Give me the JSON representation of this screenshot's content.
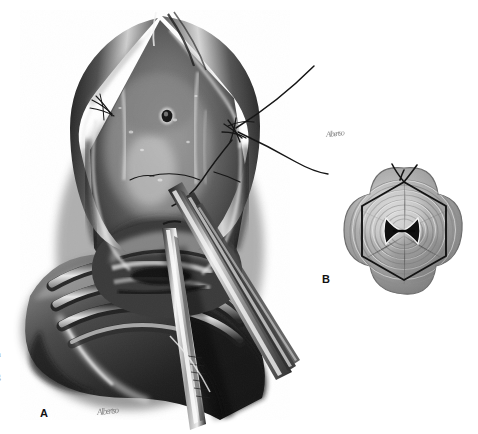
{
  "figure": {
    "medium": "grayscale airbrush and pencil medical illustration",
    "background_color": "#ffffff",
    "width": 478,
    "height": 434,
    "panels": [
      {
        "id": "A",
        "label": "A",
        "label_position": {
          "x": 40,
          "y": 407
        },
        "caption": "Open operative field, tissue edges retracted, suture placed with curved needle, forceps introduced into lumen",
        "signature": "Albertso"
      },
      {
        "id": "B",
        "label": "B",
        "label_position": {
          "x": 322,
          "y": 273
        },
        "caption": "Cross-section: four-lobed fibrous wall with concentric rings, hexagonal encircling suture, central bowtie-shaped lumen",
        "signature": "Albertso"
      }
    ]
  },
  "margin": {
    "clipped_lines": [
      "t",
      "n",
      "f",
      "g"
    ],
    "note": "partial clipped text from facing page column"
  },
  "palette": {
    "paper": "#ffffff",
    "tissue_dark": "#2b2b2b",
    "tissue_mid": "#6d6d6d",
    "tissue_light": "#c9c9c9",
    "highlight": "#f2f2f2",
    "suture": "#1a1a1a",
    "instrument_steel": "#dcdcdc",
    "instrument_shadow": "#3a3a3a",
    "panelb_fiber": "#9b9b9b",
    "label_color": "#111111",
    "signature_color": "#6a6a6a"
  },
  "elements": {
    "panel_a": {
      "retracted_flaps": "two triangular tissue flaps peeled laterally forming an inverted V opening",
      "orifice": "small dark punctate opening with light rim, upper mid-field",
      "cartilage_rings": "three to four curved pale tracheal rings, lower left",
      "suture_threads": "long black monofilament strands trailing to upper right",
      "needle_bite": "suture knot / needle pass at right tissue edge",
      "instruments": "two long forceps blades with metallic highlights entering lumen from lower right"
    },
    "panel_b": {
      "outer_contour": "quatrefoil four-lobed outline",
      "fiber_rings": "concentric stippled fibromuscular rings",
      "suture_loop": "dark hexagonal encircling suture with knot at apex",
      "suture_tails": "two short tails rising from the apex knot",
      "lumen": "central bowtie / H-shaped slit, dark with light rim"
    }
  }
}
